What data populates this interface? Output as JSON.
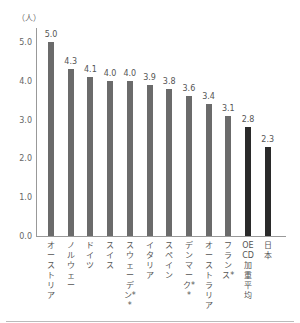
{
  "chart_data": {
    "type": "bar",
    "title": "",
    "ylabel": "（人）",
    "xlabel": "",
    "ylim": [
      0,
      5.0
    ],
    "yticks": [
      "0.0",
      "1.0",
      "2.0",
      "3.0",
      "4.0",
      "5.0"
    ],
    "grid": false,
    "legend": null,
    "categories": [
      "オーストリア",
      "ノルウェー",
      "ドイツ",
      "スイス",
      "スウェーデン**",
      "イタリア",
      "スペイン",
      "デンマーク**",
      "オーストラリア",
      "フランス*",
      "OECD加重平均",
      "日本"
    ],
    "values": [
      5.0,
      4.3,
      4.1,
      4.0,
      4.0,
      3.9,
      3.8,
      3.6,
      3.4,
      3.1,
      2.8,
      2.3
    ],
    "value_labels": [
      "5.0",
      "4.3",
      "4.1",
      "4.0",
      "4.0",
      "3.9",
      "3.8",
      "3.6",
      "3.4",
      "3.1",
      "2.8",
      "2.3"
    ],
    "colors": [
      "#6b6b6b",
      "#6b6b6b",
      "#6b6b6b",
      "#6b6b6b",
      "#6b6b6b",
      "#6b6b6b",
      "#6b6b6b",
      "#6b6b6b",
      "#6b6b6b",
      "#6b6b6b",
      "#2a2a2a",
      "#2a2a2a"
    ]
  }
}
